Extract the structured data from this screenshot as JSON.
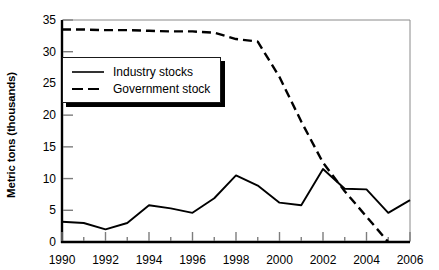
{
  "chart_data": {
    "type": "line",
    "title": "",
    "xlabel": "",
    "ylabel": "Metric tons (thousands)",
    "xlim": [
      1990,
      2006
    ],
    "ylim": [
      0,
      35
    ],
    "ytick_step": 5,
    "xtick_step": 2,
    "xminor_step": 1,
    "grid": false,
    "legend_position": "upper-left-inside",
    "x": [
      1990,
      1991,
      1992,
      1993,
      1994,
      1995,
      1996,
      1997,
      1998,
      1999,
      2000,
      2001,
      2002,
      2003,
      2004,
      2005,
      2006
    ],
    "yticks": [
      0,
      5,
      10,
      15,
      20,
      25,
      30,
      35
    ],
    "ytick_labels": [
      "0",
      "5",
      "10",
      "15",
      "20",
      "25",
      "30",
      "35"
    ],
    "xticks": [
      1990,
      1992,
      1994,
      1996,
      1998,
      2000,
      2002,
      2004,
      2006
    ],
    "xtick_labels": [
      "1990",
      "1992",
      "1994",
      "1996",
      "1998",
      "2000",
      "2002",
      "2004",
      "2006"
    ],
    "series": [
      {
        "name": "Industry stocks",
        "style": "solid",
        "color": "#000000",
        "values": [
          3.2,
          3.0,
          2.0,
          3.0,
          5.8,
          5.3,
          4.6,
          6.9,
          10.5,
          8.9,
          6.2,
          5.8,
          11.5,
          8.4,
          8.3,
          4.6,
          6.6
        ]
      },
      {
        "name": "Government stock",
        "style": "dashed",
        "color": "#000000",
        "values": [
          33.5,
          33.5,
          33.4,
          33.4,
          33.3,
          33.2,
          33.2,
          33.0,
          32.0,
          31.6,
          26.0,
          19.0,
          12.5,
          8.0,
          4.0,
          0.0,
          null
        ]
      }
    ]
  },
  "legend": {
    "items": [
      {
        "label": "Industry stocks",
        "style": "solid"
      },
      {
        "label": "Government stock",
        "style": "dashed"
      }
    ]
  },
  "colors": {
    "ink": "#000000",
    "frame": "#8a8a8a",
    "background": "#ffffff"
  }
}
